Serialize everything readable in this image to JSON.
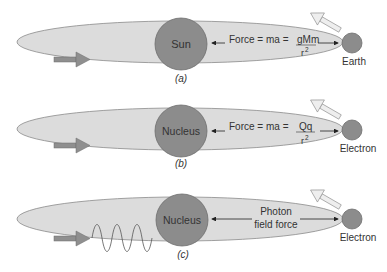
{
  "colors": {
    "orbit_fill": "#dcdcdc",
    "orbit_stroke": "#8a8a8a",
    "body_fill": "#8c8c8c",
    "body_stroke": "#6e6e6e",
    "arrow_dark": "#8f8f8f",
    "arrow_light": "#e8e8e8",
    "text": "#333333"
  },
  "panels": [
    {
      "id": "a",
      "caption": "(a)",
      "center_body": "Sun",
      "orbiting_body": "Earth",
      "force_text": "Force = ma = ",
      "numerator": "gMm",
      "denominator": "r",
      "exponent": "2"
    },
    {
      "id": "b",
      "caption": "(b)",
      "center_body": "Nucleus",
      "orbiting_body": "Electron",
      "force_text": "Force = ma = ",
      "numerator": "Qq",
      "denominator": "r",
      "exponent": "2"
    },
    {
      "id": "c",
      "caption": "(c)",
      "center_body": "Nucleus",
      "orbiting_body": "Electron",
      "force_line1": "Photon",
      "force_line2": "field force"
    }
  ]
}
